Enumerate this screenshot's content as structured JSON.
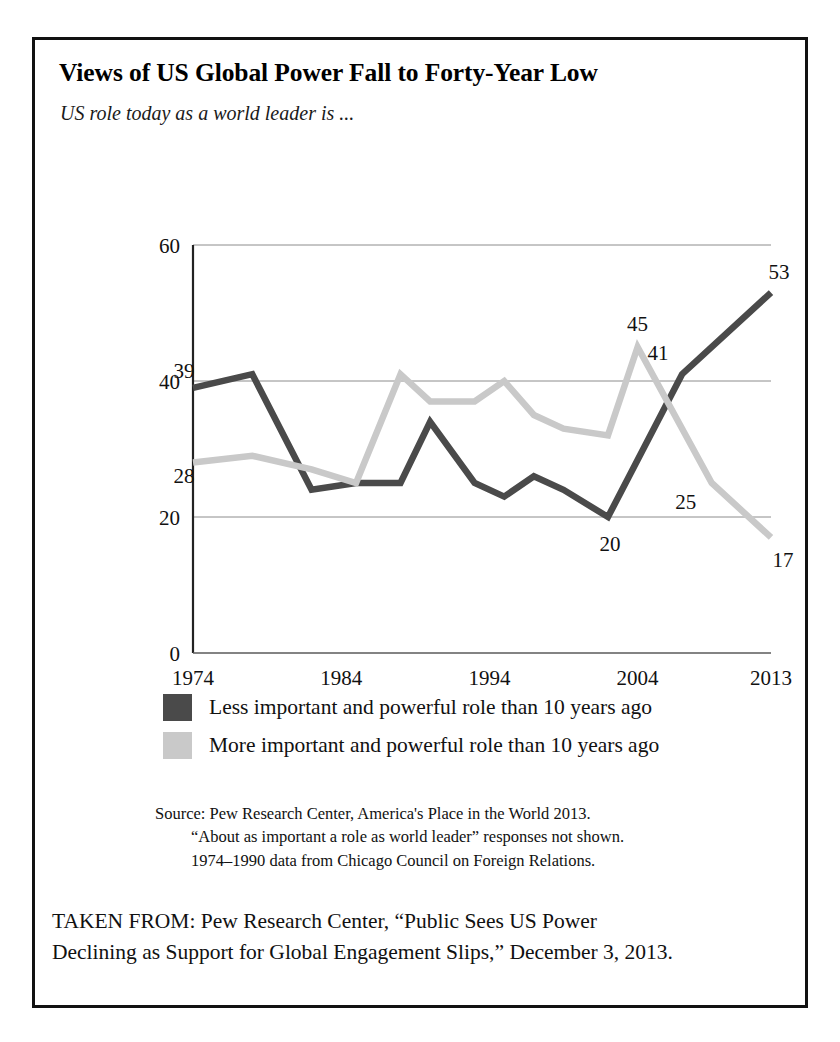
{
  "figure": {
    "title": "Views of US Global Power Fall to Forty-Year Low",
    "subtitle": "US role today as a world leader is ..."
  },
  "legend": {
    "items": [
      {
        "label": "Less important and powerful role than 10 years ago",
        "color": "#4a4a4a"
      },
      {
        "label": "More important and powerful role than 10 years ago",
        "color": "#c9c9c9"
      }
    ]
  },
  "source_note": {
    "line1": "Source: Pew Research Center, America's Place in the World 2013.",
    "line2": "“About as important a role as world leader” responses not shown.",
    "line3": "1974–1990 data from Chicago Council on Foreign Relations."
  },
  "taken_from": {
    "line1": "TAKEN FROM: Pew Research Center, “Public Sees US Power",
    "line2": "Declining as Support for Global Engagement Slips,” December 3, 2013."
  },
  "axis": {
    "y_ticks": [
      "0",
      "20",
      "40",
      "60"
    ],
    "x_ticks": [
      "1974",
      "1984",
      "1994",
      "2004",
      "2013"
    ]
  },
  "chart_data": {
    "type": "line",
    "title": "Views of US Global Power Fall to Forty-Year Low",
    "subtitle": "US role today as a world leader is ...",
    "xlabel": "",
    "ylabel": "",
    "ylim": [
      0,
      60
    ],
    "yticks": [
      0,
      20,
      40,
      60
    ],
    "grid": "horizontal",
    "legend_position": "below",
    "x": [
      1974,
      1978,
      1982,
      1985,
      1988,
      1990,
      1993,
      1995,
      1997,
      1999,
      2002,
      2004,
      2007,
      2009,
      2013
    ],
    "xtick_values": [
      1974,
      1984,
      1994,
      2004,
      2013
    ],
    "xtick_labels": [
      "1974",
      "1984",
      "1994",
      "2004",
      "2013"
    ],
    "series": [
      {
        "name": "Less important and powerful role than 10 years ago",
        "color": "#4a4a4a",
        "values": [
          39,
          41,
          24,
          25,
          25,
          34,
          25,
          23,
          26,
          24,
          20,
          41,
          53
        ],
        "x": [
          1974,
          1978,
          1982,
          1985,
          1988,
          1990,
          1993,
          1995,
          1997,
          1999,
          2002,
          2007,
          2013
        ]
      },
      {
        "name": "More important and powerful role than 10 years ago",
        "color": "#c9c9c9",
        "values": [
          28,
          29,
          27,
          25,
          41,
          37,
          37,
          40,
          35,
          33,
          32,
          45,
          25,
          17
        ],
        "x": [
          1974,
          1978,
          1982,
          1985,
          1988,
          1990,
          1993,
          1995,
          1997,
          1999,
          2002,
          2004,
          2009,
          2013
        ]
      }
    ],
    "annotations": [
      {
        "text": "39",
        "series": "Less important and powerful role than 10 years ago",
        "value": 39,
        "x": 1974
      },
      {
        "text": "28",
        "series": "More important and powerful role than 10 years ago",
        "value": 28,
        "x": 1974
      },
      {
        "text": "45",
        "series": "More important and powerful role than 10 years ago",
        "value": 45,
        "x": 2004
      },
      {
        "text": "25",
        "series": "More important and powerful role than 10 years ago",
        "value": 25,
        "x": 2009
      },
      {
        "text": "17",
        "series": "More important and powerful role than 10 years ago",
        "value": 17,
        "x": 2013
      },
      {
        "text": "20",
        "series": "Less important and powerful role than 10 years ago",
        "value": 20,
        "x": 2002
      },
      {
        "text": "41",
        "series": "Less important and powerful role than 10 years ago",
        "value": 41,
        "x": 2007
      },
      {
        "text": "53",
        "series": "Less important and powerful role than 10 years ago",
        "value": 53,
        "x": 2013
      }
    ]
  }
}
